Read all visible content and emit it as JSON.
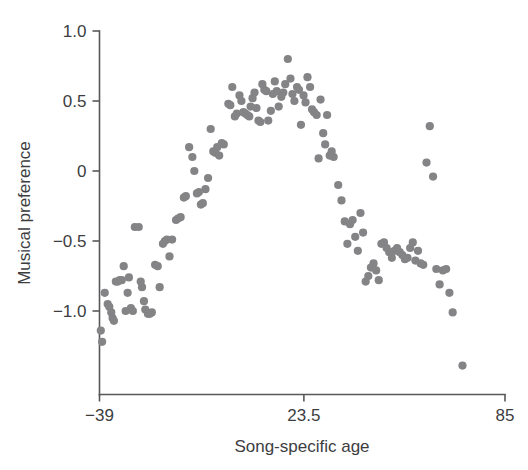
{
  "chart_data": {
    "type": "scatter",
    "title": "",
    "subtitle": "",
    "xlabel": "Song-specific age",
    "ylabel": "Musical preference",
    "xlim": [
      -39,
      85
    ],
    "ylim": [
      -1.45,
      1.0
    ],
    "xticks": [
      -39,
      23.5,
      85
    ],
    "xtick_labels": [
      "−39",
      "23.5",
      "85"
    ],
    "yticks": [
      1.0,
      0.5,
      0,
      -0.5,
      -1.0
    ],
    "ytick_labels": [
      "1.0",
      "0.5",
      "0",
      "−0.5",
      "−1.0"
    ],
    "grid": false,
    "legend": null,
    "marker": {
      "shape": "circle",
      "color": "#848486",
      "size_px": 8.2
    },
    "series": [
      {
        "name": "Musical preference by song-specific age",
        "color": "#848486",
        "points": [
          [
            -38.6,
            -1.14
          ],
          [
            -38.2,
            -1.22
          ],
          [
            -37.4,
            -0.87
          ],
          [
            -36.5,
            -0.95
          ],
          [
            -36.0,
            -0.97
          ],
          [
            -35.4,
            -1.01
          ],
          [
            -35.0,
            -1.05
          ],
          [
            -34.6,
            -1.07
          ],
          [
            -34.0,
            -0.79
          ],
          [
            -33.4,
            -0.79
          ],
          [
            -32.8,
            -0.78
          ],
          [
            -32.2,
            -0.78
          ],
          [
            -31.6,
            -0.68
          ],
          [
            -31.0,
            -1.0
          ],
          [
            -30.4,
            -0.87
          ],
          [
            -30.0,
            -0.76
          ],
          [
            -29.4,
            -0.98
          ],
          [
            -28.8,
            -1.0
          ],
          [
            -28.2,
            -0.4
          ],
          [
            -27.0,
            -0.4
          ],
          [
            -26.4,
            -0.79
          ],
          [
            -26.0,
            -0.83
          ],
          [
            -25.4,
            -0.93
          ],
          [
            -25.0,
            -0.99
          ],
          [
            -24.2,
            -1.02
          ],
          [
            -23.6,
            -1.02
          ],
          [
            -23.0,
            -1.01
          ],
          [
            -22.0,
            -0.67
          ],
          [
            -21.2,
            -0.68
          ],
          [
            -20.6,
            -0.83
          ],
          [
            -19.6,
            -0.52
          ],
          [
            -19.0,
            -0.5
          ],
          [
            -18.4,
            -0.49
          ],
          [
            -17.6,
            -0.61
          ],
          [
            -16.8,
            -0.49
          ],
          [
            -15.6,
            -0.35
          ],
          [
            -15.0,
            -0.34
          ],
          [
            -14.2,
            -0.33
          ],
          [
            -13.2,
            -0.19
          ],
          [
            -12.6,
            -0.18
          ],
          [
            -11.6,
            0.17
          ],
          [
            -10.6,
            0.1
          ],
          [
            -10.0,
            0.0
          ],
          [
            -9.2,
            -0.16
          ],
          [
            -8.6,
            -0.15
          ],
          [
            -8.0,
            -0.24
          ],
          [
            -7.4,
            -0.23
          ],
          [
            -6.6,
            -0.13
          ],
          [
            -5.8,
            -0.05
          ],
          [
            -5.0,
            0.3
          ],
          [
            -4.2,
            0.14
          ],
          [
            -3.6,
            0.13
          ],
          [
            -3.0,
            0.17
          ],
          [
            -2.4,
            0.11
          ],
          [
            -1.6,
            0.2
          ],
          [
            -1.0,
            0.19
          ],
          [
            0.4,
            0.48
          ],
          [
            1.0,
            0.47
          ],
          [
            1.6,
            0.6
          ],
          [
            2.4,
            0.39
          ],
          [
            3.0,
            0.41
          ],
          [
            3.8,
            0.54
          ],
          [
            4.4,
            0.5
          ],
          [
            5.0,
            0.42
          ],
          [
            5.6,
            0.41
          ],
          [
            6.2,
            0.4
          ],
          [
            6.8,
            0.39
          ],
          [
            7.2,
            0.46
          ],
          [
            7.8,
            0.52
          ],
          [
            8.4,
            0.56
          ],
          [
            9.0,
            0.45
          ],
          [
            9.6,
            0.36
          ],
          [
            10.2,
            0.35
          ],
          [
            10.8,
            0.62
          ],
          [
            11.4,
            0.58
          ],
          [
            12.0,
            0.57
          ],
          [
            12.6,
            0.36
          ],
          [
            13.4,
            0.43
          ],
          [
            14.0,
            0.55
          ],
          [
            14.6,
            0.64
          ],
          [
            15.2,
            0.57
          ],
          [
            15.8,
            0.46
          ],
          [
            16.6,
            0.53
          ],
          [
            17.2,
            0.56
          ],
          [
            17.8,
            0.62
          ],
          [
            18.6,
            0.8
          ],
          [
            19.4,
            0.66
          ],
          [
            20.0,
            0.55
          ],
          [
            20.6,
            0.5
          ],
          [
            21.4,
            0.6
          ],
          [
            22.0,
            0.58
          ],
          [
            22.6,
            0.33
          ],
          [
            23.4,
            0.54
          ],
          [
            24.0,
            0.49
          ],
          [
            24.6,
            0.67
          ],
          [
            25.4,
            0.6
          ],
          [
            26.0,
            0.44
          ],
          [
            26.6,
            0.42
          ],
          [
            27.4,
            0.4
          ],
          [
            28.0,
            0.09
          ],
          [
            28.6,
            0.51
          ],
          [
            29.4,
            0.27
          ],
          [
            30.0,
            0.19
          ],
          [
            30.6,
            0.4
          ],
          [
            31.4,
            0.11
          ],
          [
            32.0,
            0.14
          ],
          [
            32.6,
            0.1
          ],
          [
            34.0,
            -0.1
          ],
          [
            35.0,
            -0.21
          ],
          [
            36.0,
            -0.36
          ],
          [
            36.8,
            -0.52
          ],
          [
            37.6,
            -0.38
          ],
          [
            38.4,
            -0.35
          ],
          [
            39.2,
            -0.47
          ],
          [
            40.0,
            -0.57
          ],
          [
            40.8,
            -0.3
          ],
          [
            41.6,
            -0.44
          ],
          [
            42.4,
            -0.79
          ],
          [
            43.2,
            -0.75
          ],
          [
            44.0,
            -0.69
          ],
          [
            44.8,
            -0.66
          ],
          [
            45.6,
            -0.71
          ],
          [
            46.4,
            -0.78
          ],
          [
            47.2,
            -0.52
          ],
          [
            48.0,
            -0.51
          ],
          [
            48.8,
            -0.55
          ],
          [
            49.6,
            -0.58
          ],
          [
            50.4,
            -0.62
          ],
          [
            51.2,
            -0.57
          ],
          [
            52.0,
            -0.55
          ],
          [
            52.8,
            -0.58
          ],
          [
            53.6,
            -0.6
          ],
          [
            54.4,
            -0.63
          ],
          [
            55.2,
            -0.62
          ],
          [
            56.0,
            -0.55
          ],
          [
            56.8,
            -0.51
          ],
          [
            57.6,
            -0.64
          ],
          [
            58.4,
            -0.57
          ],
          [
            59.2,
            -0.66
          ],
          [
            60.0,
            -0.67
          ],
          [
            61.0,
            0.06
          ],
          [
            62.0,
            0.32
          ],
          [
            63.0,
            -0.04
          ],
          [
            64.0,
            -0.7
          ],
          [
            65.0,
            -0.81
          ],
          [
            66.0,
            -0.71
          ],
          [
            67.0,
            -0.7
          ],
          [
            68.0,
            -0.87
          ],
          [
            69.0,
            -1.01
          ],
          [
            72.0,
            -1.39
          ]
        ]
      }
    ]
  },
  "axes": {
    "y_axis_name": "y-axis",
    "x_axis_name": "x-axis"
  }
}
